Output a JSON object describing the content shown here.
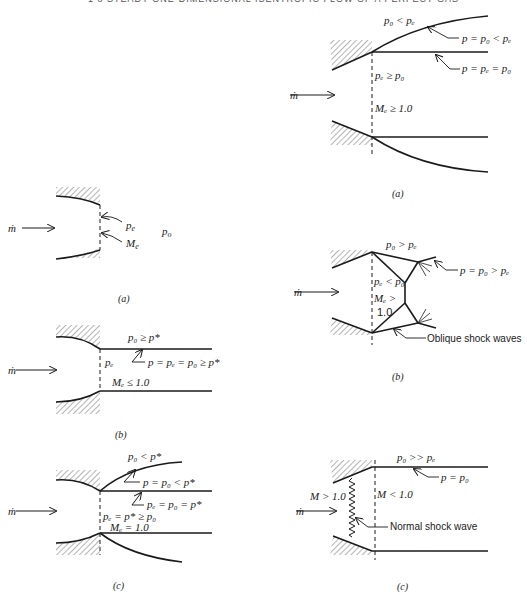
{
  "header": {
    "text": "1 8   STEADY ONE-DIMENSIONAL ISENTROPIC FLOW OF A PERFECT GAS"
  },
  "left_column": {
    "a": {
      "caption": "(a)",
      "mdot": "ṁ",
      "pe": "p",
      "pe_sub": "e",
      "Me": "M",
      "Me_sub": "e",
      "po": "p",
      "po_sub": "o"
    },
    "b": {
      "caption": "(b)",
      "mdot": "ṁ",
      "top": "p₀ ≥ p*",
      "pe": "pₑ",
      "arrow_label": "p = pₑ = p₀ ≥ p*",
      "Me": "Mₑ ≤ 1.0"
    },
    "c": {
      "caption": "(c)",
      "mdot": "ṁ",
      "top": "p₀ < p*",
      "label1": "p = p₀ < p*",
      "label2": "pₑ = p₀ = p*",
      "pe": "pₑ = p* ≥ p₀",
      "Me": "Mₑ = 1.0"
    }
  },
  "right_column": {
    "a": {
      "caption": "(a)",
      "mdot": "ṁ",
      "top": "p₀ < pₑ",
      "label1": "p = p₀ < pₑ",
      "label2": "p = pₑ = p₀",
      "pe": "pₑ ≥ p₀",
      "Me": "Mₑ ≥ 1.0"
    },
    "b": {
      "caption": "(b)",
      "mdot": "ṁ",
      "top": "p₀ > pₑ",
      "label1": "p = p₀ > pₑ",
      "pe": "pₑ < p₀",
      "Me": "Mₑ >",
      "Me2": "1.0",
      "shock_label": "Oblique shock waves"
    },
    "c": {
      "caption": "(c)",
      "mdot": "ṁ",
      "top": "p₀ >> pₑ",
      "label1": "p = p₀",
      "M_up": "M > 1.0",
      "M_down": "M < 1.0",
      "shock_label": "Normal shock wave"
    }
  }
}
